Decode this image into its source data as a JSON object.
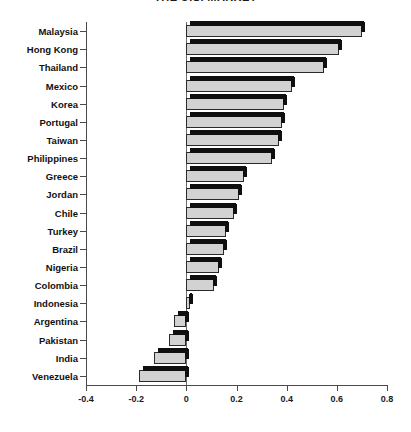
{
  "chart": {
    "title": "THE U.S. MARKET"
  },
  "chart_data": {
    "type": "bar",
    "orientation": "horizontal",
    "title": "THE U.S. MARKET",
    "xlabel": "",
    "ylabel": "",
    "xlim": [
      -0.4,
      0.8
    ],
    "xticks": [
      "-0.4",
      "-0.2",
      "0",
      "0.2",
      "0.4",
      "0.6",
      "0.8"
    ],
    "xtick_values": [
      -0.4,
      -0.2,
      0,
      0.2,
      0.4,
      0.6,
      0.8
    ],
    "grid": false,
    "legend": false,
    "style": "3d-shadow-bars",
    "bar_face_color": "#d2d2d2",
    "bar_shadow_color": "#0f0f0f",
    "axis_color": "#4a4a4a",
    "categories": [
      "Malaysia",
      "Hong Kong",
      "Thailand",
      "Mexico",
      "Korea",
      "Portugal",
      "Taiwan",
      "Philippines",
      "Greece",
      "Jordan",
      "Chile",
      "Turkey",
      "Brazil",
      "Nigeria",
      "Colombia",
      "Indonesia",
      "Argentina",
      "Pakistan",
      "India",
      "Venezuela"
    ],
    "values": [
      0.7,
      0.61,
      0.55,
      0.42,
      0.39,
      0.38,
      0.37,
      0.34,
      0.23,
      0.21,
      0.19,
      0.16,
      0.15,
      0.13,
      0.11,
      0.015,
      -0.05,
      -0.07,
      -0.13,
      -0.19
    ]
  }
}
